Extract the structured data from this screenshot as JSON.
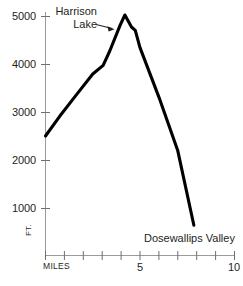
{
  "chart_data": {
    "type": "line",
    "title": "",
    "subtitle": "",
    "xlabel": "MILES",
    "ylabel": "FT.",
    "xlim": [
      0,
      10
    ],
    "ylim": [
      0,
      5400
    ],
    "grid": false,
    "legend": null,
    "x_ticks": [
      0,
      1,
      2,
      3,
      4,
      5,
      6,
      7,
      8,
      9,
      10
    ],
    "x_tick_labels": [
      "MILES",
      "",
      "",
      "",
      "",
      "5",
      "",
      "",
      "",
      "",
      "10"
    ],
    "y_ticks": [
      1000,
      2000,
      3000,
      4000,
      5000
    ],
    "y_tick_labels": [
      "1000",
      "2000",
      "3000",
      "4000",
      "5000"
    ],
    "series": [
      {
        "name": "Elevation profile",
        "color": "#000000",
        "x": [
          0.0,
          0.75,
          1.6,
          2.5,
          3.05,
          3.4,
          3.95,
          4.2,
          4.55,
          4.75,
          5.0,
          6.0,
          7.0,
          7.85
        ],
        "y": [
          2490,
          2900,
          3330,
          3780,
          3960,
          4260,
          4800,
          5010,
          4760,
          4690,
          4330,
          3300,
          2180,
          630
        ]
      }
    ],
    "annotations": [
      {
        "id": "harrison-lake",
        "text_line1": "Harrison",
        "text_line2": "Lake",
        "arrow": true,
        "points_to_x": 3.95,
        "points_to_y": 4800
      },
      {
        "id": "dosewallips-valley",
        "text_line1": "Dosewallips Valley",
        "arrow": false,
        "points_to_x": 7.85,
        "points_to_y": 630
      }
    ]
  },
  "axes": {
    "axis_color": "#9a9a9a",
    "curve_color": "#000000",
    "y_unit_label": "FT.",
    "x_origin_label": "MILES"
  }
}
